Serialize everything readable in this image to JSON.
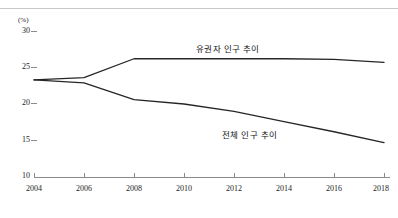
{
  "chart_data": {
    "type": "line",
    "title": "",
    "subtitle": "",
    "xlabel": "",
    "ylabel": "",
    "unit_label": "(%)",
    "grid": false,
    "legend_position": "inline-annotation",
    "x": [
      2004,
      2006,
      2008,
      2010,
      2012,
      2014,
      2016,
      2018
    ],
    "x_tick_labels": [
      "2004",
      "2006",
      "2008",
      "2010",
      "2012",
      "2014",
      "2016",
      "2018"
    ],
    "y_tick_labels": [
      "10",
      "15",
      "20",
      "25",
      "30"
    ],
    "y_ticks": [
      10,
      15,
      20,
      25,
      30
    ],
    "xlim": [
      2004,
      2018
    ],
    "ylim": [
      10,
      30
    ],
    "series": [
      {
        "name": "유권자 인구 추이",
        "values": [
          23.3,
          23.6,
          26.2,
          26.2,
          26.2,
          26.2,
          26.1,
          25.7
        ],
        "color": "#262626"
      },
      {
        "name": "전체 인구 추이",
        "values": [
          23.3,
          22.9,
          20.6,
          20.0,
          19.0,
          17.6,
          16.2,
          14.7
        ],
        "color": "#262626"
      }
    ],
    "annotations": [
      {
        "text": "유권자 인구 추이",
        "x": 2012,
        "y": 27.0
      },
      {
        "text": "전체 인구 추이",
        "x": 2014,
        "y": 15.6
      }
    ]
  },
  "axis": {
    "unit": "(%)",
    "y_labels": [
      "30",
      "25",
      "20",
      "15",
      "10"
    ],
    "x_labels": [
      "2004",
      "2006",
      "2008",
      "2010",
      "2012",
      "2014",
      "2016",
      "2018"
    ]
  },
  "colors": {
    "line": "#262626",
    "axis": "#7f7f7f",
    "rule": "#c9c9c9",
    "text": "#1b1b1b"
  }
}
